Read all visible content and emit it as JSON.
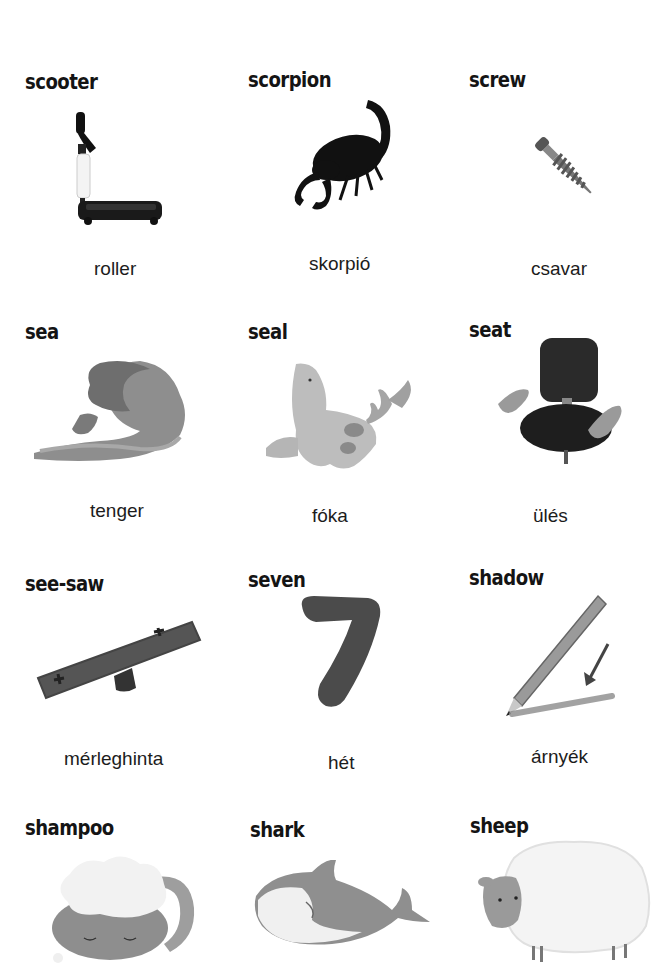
{
  "page": {
    "entries": [
      {
        "english": "scooter",
        "hungarian": "roller",
        "icon": "scooter-icon"
      },
      {
        "english": "scorpion",
        "hungarian": "skorpió",
        "icon": "scorpion-icon"
      },
      {
        "english": "screw",
        "hungarian": "csavar",
        "icon": "screw-icon"
      },
      {
        "english": "sea",
        "hungarian": "tenger",
        "icon": "wave-icon"
      },
      {
        "english": "seal",
        "hungarian": "fóka",
        "icon": "seal-icon"
      },
      {
        "english": "seat",
        "hungarian": "ülés",
        "icon": "chair-icon"
      },
      {
        "english": "see-saw",
        "hungarian": "mérleghinta",
        "icon": "seesaw-icon"
      },
      {
        "english": "seven",
        "hungarian": "hét",
        "icon": "number-seven-icon"
      },
      {
        "english": "shadow",
        "hungarian": "árnyék",
        "icon": "pencil-shadow-icon"
      },
      {
        "english": "shampoo",
        "hungarian": "",
        "icon": "shampoo-cat-icon"
      },
      {
        "english": "shark",
        "hungarian": "",
        "icon": "shark-icon"
      },
      {
        "english": "sheep",
        "hungarian": "",
        "icon": "sheep-icon"
      }
    ]
  }
}
